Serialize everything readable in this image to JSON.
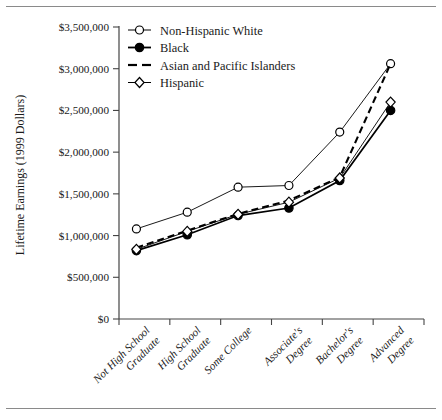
{
  "figure": {
    "top_rule": "horizontal-rule",
    "bottom_rule": "horizontal-rule"
  },
  "chart_data": {
    "type": "line",
    "title": "",
    "xlabel": "",
    "ylabel": "Lifetime Earnings (1999 Dollars)",
    "ylim": [
      0,
      3500000
    ],
    "ytick_labels": [
      "$0",
      "$500,000",
      "$1,000,000",
      "$1,500,000",
      "$2,000,000",
      "$2,500,000",
      "$3,000,000",
      "$3,500,000"
    ],
    "ytick_values": [
      0,
      500000,
      1000000,
      1500000,
      2000000,
      2500000,
      3000000,
      3500000
    ],
    "grid": false,
    "legend_position": "top-left-inside",
    "categories": [
      "Not High School Graduate",
      "High School Graduate",
      "Some College",
      "Associate's Degree",
      "Bachelor's Degree",
      "Advanced Degree"
    ],
    "categories_lines": [
      [
        "Not High School",
        "Graduate"
      ],
      [
        "High School",
        "Graduate"
      ],
      [
        "Some College"
      ],
      [
        "Associate's",
        "Degree"
      ],
      [
        "Bachelor's",
        "Degree"
      ],
      [
        "Advanced",
        "Degree"
      ]
    ],
    "series": [
      {
        "name": "Non-Hispanic White",
        "marker": "open-circle",
        "dash": "none",
        "values": [
          1080000,
          1280000,
          1580000,
          1600000,
          2240000,
          3060000
        ]
      },
      {
        "name": "Black",
        "marker": "filled-circle",
        "dash": "none",
        "values": [
          820000,
          1010000,
          1240000,
          1330000,
          1660000,
          2500000
        ]
      },
      {
        "name": "Asian and Pacific Islanders",
        "marker": "none",
        "dash": "dashed",
        "values": [
          855000,
          1060000,
          1260000,
          1420000,
          1700000,
          3060000
        ]
      },
      {
        "name": "Hispanic",
        "marker": "open-diamond",
        "dash": "none",
        "values": [
          835000,
          1050000,
          1255000,
          1400000,
          1690000,
          2600000
        ]
      }
    ]
  },
  "legend": {
    "items": [
      {
        "label": "Non-Hispanic White",
        "marker": "open-circle",
        "dash": "none"
      },
      {
        "label": "Black",
        "marker": "filled-circle",
        "dash": "none"
      },
      {
        "label": "Asian and Pacific Islanders",
        "marker": "none",
        "dash": "dashed"
      },
      {
        "label": "Hispanic",
        "marker": "open-diamond",
        "dash": "none"
      }
    ]
  },
  "colors": {
    "ink": "#1a1a1a",
    "axis": "#444444",
    "rule": "#8a8a8a",
    "series_line": "#000000",
    "background": "#ffffff"
  }
}
